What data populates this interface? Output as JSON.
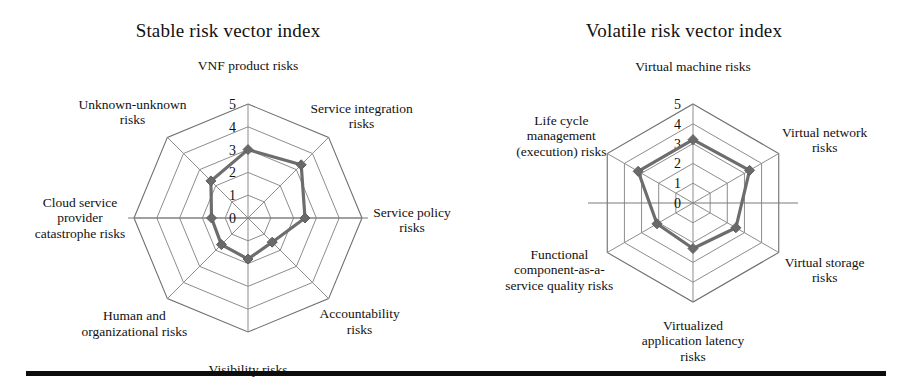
{
  "figure": {
    "background_color": "#ffffff",
    "series_color": "#6d6d6d",
    "grid_color": "#8d8d8d",
    "footer_rule_color": "#0d0d0d"
  },
  "charts": [
    {
      "id": "stable-risk-vector-index",
      "title": "Stable risk vector index",
      "tick_labels": [
        "0",
        "1",
        "2",
        "3",
        "4",
        "5"
      ],
      "axis_labels": [
        "VNF product risks",
        "Service integration\nrisks",
        "Service policy\nrisks",
        "Accountability\nrisks",
        "Visibility risks",
        "Human and\norganizational risks",
        "Cloud service\nprovider\ncatastrophe risks",
        "Unknown-unknown\nrisks"
      ]
    },
    {
      "id": "volatile-risk-vector-index",
      "title": "Volatile risk vector index",
      "tick_labels": [
        "0",
        "1",
        "2",
        "3",
        "4",
        "5"
      ],
      "axis_labels": [
        "Virtual machine risks",
        "Virtual network\nrisks",
        "Virtual storage\nrisks",
        "Virtualized\napplication latency\nrisks",
        "Functional\ncomponent-as-a-\nservice quality risks",
        "Life cycle\nmanagement\n(execution) risks"
      ]
    }
  ],
  "chart_data": [
    {
      "type": "radar",
      "title": "Stable risk vector index",
      "categories": [
        "VNF product risks",
        "Service integration risks",
        "Service policy risks",
        "Accountability risks",
        "Visibility risks",
        "Human and organizational risks",
        "Cloud service provider catastrophe risks",
        "Unknown-unknown risks"
      ],
      "series": [
        {
          "name": "Stable risk vector index",
          "values": [
            3.0,
            3.3,
            2.5,
            1.5,
            1.8,
            1.65,
            1.6,
            2.3
          ]
        }
      ],
      "rlim": [
        0,
        5
      ],
      "rticks": [
        0,
        1,
        2,
        3,
        4,
        5
      ],
      "grid": true,
      "legend": "none",
      "xlabel": "",
      "ylabel": ""
    },
    {
      "type": "radar",
      "title": "Volatile risk vector index",
      "categories": [
        "Virtual machine risks",
        "Virtual network risks",
        "Virtual storage risks",
        "Virtualized application latency risks",
        "Functional component-as-a-service quality risks",
        "Life cycle management (execution) risks"
      ],
      "series": [
        {
          "name": "Volatile risk vector index",
          "values": [
            3.2,
            3.3,
            2.5,
            2.3,
            2.1,
            3.2
          ]
        }
      ],
      "rlim": [
        0,
        5
      ],
      "rticks": [
        0,
        1,
        2,
        3,
        4,
        5
      ],
      "grid": true,
      "legend": "none",
      "xlabel": "",
      "ylabel": ""
    }
  ]
}
